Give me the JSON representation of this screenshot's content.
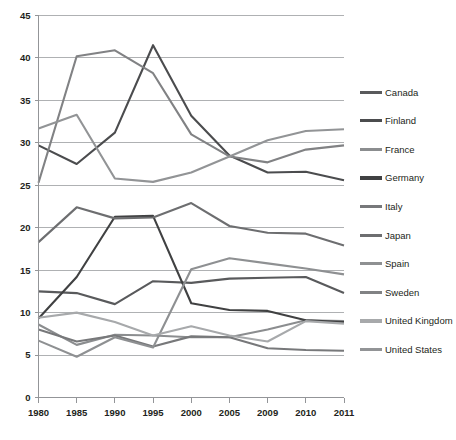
{
  "chart_data": {
    "type": "line",
    "title": "",
    "subtitle": "",
    "xlabel": "",
    "ylabel": "",
    "grid": true,
    "legend_position": "right",
    "xlim": [
      0,
      8
    ],
    "ylim": [
      0,
      45
    ],
    "y_ticks": [
      0,
      5,
      10,
      15,
      20,
      25,
      30,
      35,
      40,
      45
    ],
    "categories": [
      "1980",
      "1985",
      "1990",
      "1995",
      "2000",
      "2005",
      "2009",
      "2010",
      "2011"
    ],
    "series": [
      {
        "name": "Canada",
        "color": "#595a5c",
        "values": [
          12.5,
          12.3,
          11.0,
          13.7,
          13.5,
          14.0,
          14.1,
          14.2,
          12.3
        ]
      },
      {
        "name": "Finland",
        "color": "#4b4c4e",
        "values": [
          29.7,
          27.5,
          31.2,
          41.5,
          33.2,
          28.5,
          26.5,
          26.6,
          25.6
        ]
      },
      {
        "name": "France",
        "color": "#8b8d8f",
        "values": [
          8.6,
          6.2,
          7.4,
          7.3,
          7.1,
          7.1,
          8.0,
          9.1,
          9.0
        ]
      },
      {
        "name": "Germany",
        "color": "#404142",
        "values": [
          9.3,
          14.2,
          21.3,
          21.4,
          11.1,
          10.3,
          10.2,
          9.1,
          8.9
        ]
      },
      {
        "name": "Italy",
        "color": "#77787a",
        "values": [
          8.0,
          6.6,
          7.3,
          6.0,
          7.2,
          7.1,
          5.8,
          5.6,
          5.5
        ]
      },
      {
        "name": "Japan",
        "color": "#6d6e70",
        "values": [
          18.3,
          22.4,
          21.1,
          21.2,
          22.9,
          20.2,
          19.4,
          19.3,
          17.9
        ]
      },
      {
        "name": "Spain",
        "color": "#8e9092",
        "values": [
          6.7,
          4.8,
          7.1,
          5.9,
          15.1,
          16.4,
          15.8,
          15.2,
          14.5
        ]
      },
      {
        "name": "Sweden",
        "color": "#818284",
        "values": [
          25.3,
          40.2,
          40.9,
          38.2,
          31.0,
          28.4,
          27.7,
          29.2,
          29.7
        ]
      },
      {
        "name": "United Kingdom",
        "color": "#a7a9ab",
        "values": [
          9.4,
          10.0,
          8.9,
          7.3,
          8.4,
          7.3,
          6.6,
          9.0,
          8.7
        ]
      },
      {
        "name": "United States",
        "color": "#929496",
        "values": [
          31.7,
          33.3,
          25.8,
          25.4,
          26.5,
          28.4,
          30.3,
          31.4,
          31.6
        ]
      }
    ]
  },
  "legend": {
    "items": [
      {
        "label": "Canada"
      },
      {
        "label": "Finland"
      },
      {
        "label": "France"
      },
      {
        "label": "Germany"
      },
      {
        "label": "Italy"
      },
      {
        "label": "Japan"
      },
      {
        "label": "Spain"
      },
      {
        "label": "Sweden"
      },
      {
        "label": "United Kingdom"
      },
      {
        "label": "United States"
      }
    ]
  },
  "colors": {
    "gridline": "#a6a8ab",
    "axis": "#939598",
    "text": "#231f20",
    "background": "#ffffff"
  }
}
